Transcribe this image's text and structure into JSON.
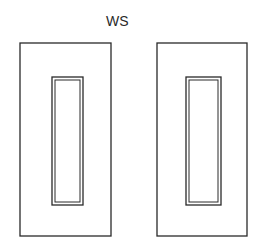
{
  "diagram": {
    "label": "WS",
    "stroke_color": "#2a2a2a",
    "panels": [
      {
        "name": "left-panel",
        "outer": {
          "x": 20,
          "y": 43,
          "w": 91,
          "h": 193
        },
        "inner_outer": {
          "x": 52,
          "y": 77,
          "w": 31,
          "h": 128
        },
        "inner_inner": {
          "x": 55,
          "y": 80,
          "w": 25,
          "h": 122
        }
      },
      {
        "name": "right-panel",
        "outer": {
          "x": 157,
          "y": 43,
          "w": 90,
          "h": 193
        },
        "inner_outer": {
          "x": 186,
          "y": 77,
          "w": 35,
          "h": 128
        },
        "inner_inner": {
          "x": 189,
          "y": 80,
          "w": 29,
          "h": 122
        }
      }
    ]
  }
}
